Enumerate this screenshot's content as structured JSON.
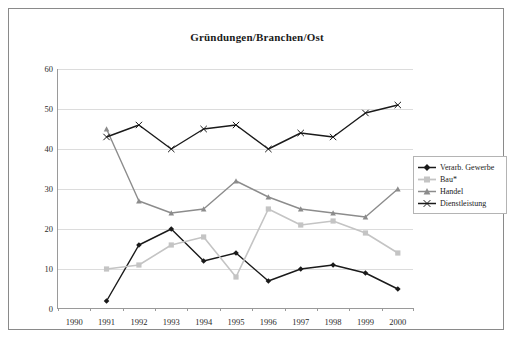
{
  "chart_data": {
    "type": "line",
    "title": "Gründungen/Branchen/Ost",
    "xlabel": "",
    "ylabel": "",
    "ylim": [
      0,
      60
    ],
    "yticks": [
      0,
      10,
      20,
      30,
      40,
      50,
      60
    ],
    "grid": true,
    "legend_position": "right",
    "categories": [
      "1990",
      "1991",
      "1992",
      "1993",
      "1994",
      "1995",
      "1996",
      "1997",
      "1998",
      "1999",
      "2000"
    ],
    "series": [
      {
        "name": "Verarb. Gewerbe",
        "color": "#1a1a1a",
        "marker": "diamond",
        "values": [
          null,
          2,
          16,
          20,
          12,
          14,
          7,
          10,
          11,
          9,
          5
        ]
      },
      {
        "name": "Bau*",
        "color": "#c4c4c4",
        "marker": "square",
        "values": [
          null,
          10,
          11,
          16,
          18,
          8,
          25,
          21,
          22,
          19,
          14
        ]
      },
      {
        "name": "Handel",
        "color": "#8c8c8c",
        "marker": "triangle",
        "values": [
          null,
          45,
          27,
          24,
          25,
          32,
          28,
          25,
          24,
          23,
          30
        ]
      },
      {
        "name": "Dienstleistung",
        "color": "#1a1a1a",
        "marker": "x",
        "values": [
          null,
          43,
          46,
          40,
          45,
          46,
          40,
          44,
          43,
          49,
          51
        ]
      }
    ]
  },
  "legend": {
    "entries": [
      "Verarb. Gewerbe",
      "Bau*",
      "Handel",
      "Dienstleistung"
    ]
  },
  "colors": {
    "frame_border": "#8a8a8a",
    "axis": "#9a9a9a",
    "gridline": "#dcdcdc",
    "background": "#ffffff",
    "text": "#1a1a1a"
  }
}
